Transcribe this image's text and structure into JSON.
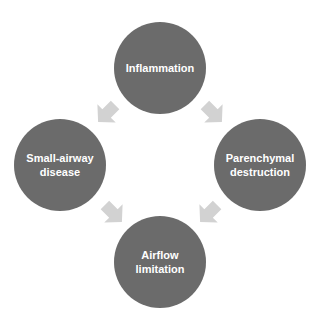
{
  "diagram": {
    "nodes": [
      {
        "id": "inflammation",
        "label": "Inflammation"
      },
      {
        "id": "small-airway",
        "label": "Small-airway\ndisease"
      },
      {
        "id": "parenchymal",
        "label": "Parenchymal\ndestruction"
      },
      {
        "id": "airflow",
        "label": "Airflow\nlimitation"
      }
    ],
    "edges": [
      {
        "from": "inflammation",
        "to": "small-airway"
      },
      {
        "from": "inflammation",
        "to": "parenchymal"
      },
      {
        "from": "small-airway",
        "to": "airflow"
      },
      {
        "from": "parenchymal",
        "to": "airflow"
      }
    ],
    "colors": {
      "node": "#6b6b6b",
      "arrow": "#d2d2d2",
      "text": "#ffffff"
    }
  }
}
